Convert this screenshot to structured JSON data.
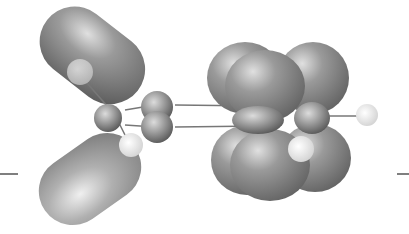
{
  "figure": {
    "type": "molecular-orbital-rendering",
    "colors": {
      "lobe": "#8a8a8a",
      "lobe_light": "#d0d0d0",
      "hydrogen": "#f2f2f2",
      "bond": "#7a7a7a",
      "background": "#ffffff",
      "energy_marker": "#555555"
    },
    "energy_markers": [
      {
        "side": "left",
        "y": 174
      },
      {
        "side": "right",
        "y": 174
      }
    ]
  }
}
